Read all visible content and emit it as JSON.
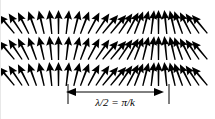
{
  "figure": {
    "name": "spin-wave-diagram",
    "background_color": "#ffffff",
    "ink_color": "#000000"
  },
  "chart_data": {
    "type": "vector-field",
    "title": "",
    "xlabel": "",
    "ylabel": "",
    "rows": 3,
    "arrows_per_row": 26,
    "row_y": [
      10,
      36,
      62
    ],
    "row_height": 24,
    "arrow_spacing": 7.7,
    "first_arrow_x": 7,
    "angle_units": "degrees, clockwise from vertical (up)",
    "angle_sequence": [
      -40,
      -34,
      -27,
      -20,
      -13,
      -6,
      0,
      7,
      14,
      21,
      28,
      34,
      40,
      40,
      34,
      28,
      21,
      14,
      7,
      0,
      -6,
      -13,
      -20,
      -27,
      -34,
      -40
    ],
    "period_arrows": 26
  },
  "measurement": {
    "label": "λ/2  =  π/k",
    "label_parts": {
      "lambda_over_two": "λ/2",
      "equals": "=",
      "pi_over_k": "π/k"
    },
    "axis_y": 92,
    "left_x": 70,
    "right_x": 158,
    "tick_left_x": 67,
    "tick_right_x": 168,
    "tick_top_y": 84,
    "tick_bottom_y": 104,
    "label_x": 114,
    "label_y": 96,
    "label_font_size": 11,
    "arrowhead_size": 5,
    "line_width": 1,
    "color": "#000000"
  }
}
